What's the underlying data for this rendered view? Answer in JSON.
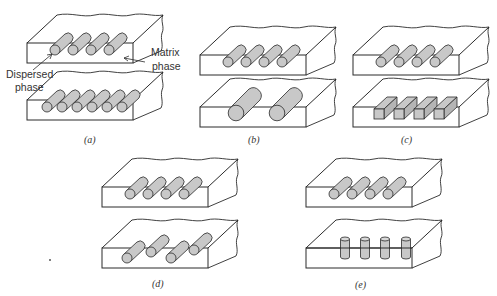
{
  "figure": {
    "annotations": {
      "matrix_label_line1": "Matrix",
      "matrix_label_line2": "phase",
      "dispersed_label_line1": "Dispersed",
      "dispersed_label_line2": "phase"
    },
    "colors": {
      "line": "#2b2b2b",
      "particle_fill": "#c8c8c8",
      "background": "#ffffff"
    },
    "panels": [
      {
        "id": "a",
        "caption": "(a)",
        "comparison": "concentration",
        "top": {
          "count": 4,
          "shape": "cylinder"
        },
        "bottom": {
          "count": 6,
          "shape": "cylinder"
        }
      },
      {
        "id": "b",
        "caption": "(b)",
        "comparison": "size",
        "top": {
          "count": 4,
          "shape": "cylinder"
        },
        "bottom": {
          "count": 2,
          "shape": "large-cylinder"
        }
      },
      {
        "id": "c",
        "caption": "(c)",
        "comparison": "shape",
        "top": {
          "count": 4,
          "shape": "cylinder"
        },
        "bottom": {
          "count": 4,
          "shape": "square-prism"
        }
      },
      {
        "id": "d",
        "caption": "(d)",
        "comparison": "distribution",
        "top": {
          "count": 4,
          "shape": "cylinder"
        },
        "bottom": {
          "count": 4,
          "shape": "cylinder-irregular"
        }
      },
      {
        "id": "e",
        "caption": "(e)",
        "comparison": "orientation",
        "top": {
          "count": 4,
          "shape": "cylinder"
        },
        "bottom": {
          "count": 4,
          "shape": "vertical-cylinder"
        }
      }
    ]
  }
}
